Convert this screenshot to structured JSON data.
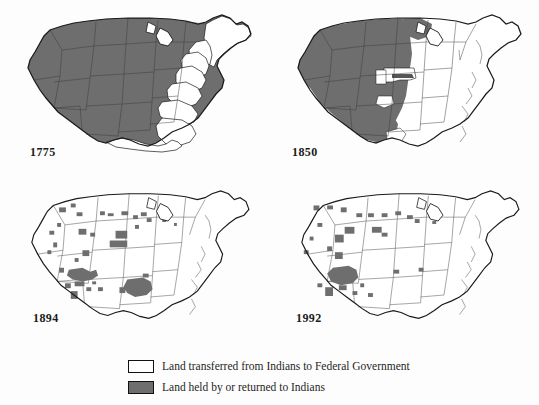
{
  "figure": {
    "kind": "map-series",
    "background_color": "#fdfdfd",
    "land_fill_gray": "#6e6e6e",
    "land_fill_white": "#ffffff",
    "outline_color": "#1a1a1a"
  },
  "panels": [
    {
      "id": "1775",
      "year_label": "1775",
      "description": "Nearly all land west of the original thirteen colonies shown in gray (Indian land); Atlantic seaboard colonies and Florida shown white."
    },
    {
      "id": "1850",
      "year_label": "1850",
      "description": "Gray Indian land confined to the trans-Mississippi West; eastern half of the country and Texas largely white, with a white wedge of organized territory pushing west across Kansas and Nebraska."
    },
    {
      "id": "1894",
      "year_label": "1894",
      "description": "Only scattered gray reservation parcels remain, largest clusters in the Southwest (Arizona, New Mexico) and Indian Territory in Oklahoma."
    },
    {
      "id": "1992",
      "year_label": "1992",
      "description": "Small gray reservations remain, concentrated in the Southwest and northern Plains; the Oklahoma Indian Territory block is gone."
    }
  ],
  "legend": {
    "items": [
      {
        "swatch": "white",
        "label": "Land transferred from Indians to Federal Government"
      },
      {
        "swatch": "gray",
        "label": "Land held by or returned to Indians"
      }
    ]
  }
}
